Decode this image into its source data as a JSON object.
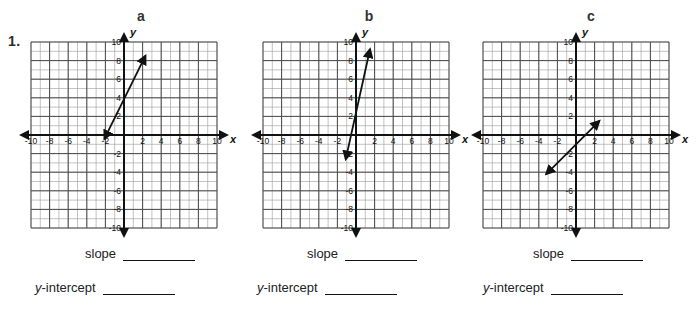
{
  "worksheet": {
    "problem_number": "1.",
    "answer_labels": {
      "slope": "slope",
      "y_intercept_italic": "y",
      "y_intercept_rest": "-intercept"
    }
  },
  "axis": {
    "x_label": "x",
    "y_label": "y",
    "x_ticks": [
      "-10",
      "-8",
      "-6",
      "-4",
      "-2",
      "2",
      "4",
      "6",
      "8",
      "10"
    ],
    "y_ticks": [
      "10",
      "8",
      "6",
      "4",
      "2",
      "-2",
      "-4",
      "-6",
      "-8",
      "-10"
    ],
    "range_min": -10,
    "range_max": 10,
    "minor_step": 1,
    "major_step": 2,
    "grid": "on"
  },
  "colors": {
    "ink": "#111111",
    "grid_minor": "#9a9a9a",
    "grid_major": "#4a4a4a",
    "paper": "#ffffff"
  },
  "graphs": [
    {
      "letter": "a",
      "line": {
        "x1": -2.1,
        "y1": -0.4,
        "x2": 2.3,
        "y2": 8.5
      },
      "slope_value": 2,
      "intercept_value": 4
    },
    {
      "letter": "b",
      "line": {
        "x1": -1.1,
        "y1": -2.6,
        "x2": 1.5,
        "y2": 9.2
      },
      "slope_value": 4.5,
      "intercept_value": 2
    },
    {
      "letter": "c",
      "line": {
        "x1": -3.2,
        "y1": -4.2,
        "x2": 2.5,
        "y2": 1.5
      },
      "slope_value": 1,
      "intercept_value": -2
    }
  ],
  "chart_data": {
    "type": "line",
    "title": "",
    "xlabel": "x",
    "ylabel": "y",
    "xlim": [
      -10,
      10
    ],
    "ylim": [
      -10,
      10
    ],
    "grid": true,
    "series": [
      {
        "name": "a",
        "x": [
          -2.1,
          2.3
        ],
        "y": [
          -0.4,
          8.5
        ],
        "slope": 2,
        "y_intercept": 4
      },
      {
        "name": "b",
        "x": [
          -1.1,
          1.5
        ],
        "y": [
          -2.6,
          9.2
        ],
        "slope": 4.5,
        "y_intercept": 2
      },
      {
        "name": "c",
        "x": [
          -3.2,
          2.5
        ],
        "y": [
          -4.2,
          1.5
        ],
        "slope": 1,
        "y_intercept": -2
      }
    ]
  }
}
